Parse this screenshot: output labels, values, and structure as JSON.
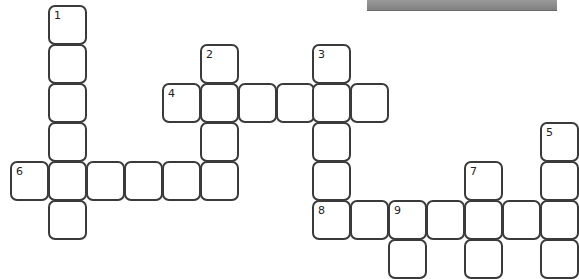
{
  "puzzle": {
    "type": "crossword",
    "geometry": {
      "col_x": [
        10,
        48,
        86,
        124,
        162,
        200,
        238,
        276,
        312,
        350,
        388,
        426,
        464,
        502,
        540
      ],
      "row_y": [
        5,
        44,
        83,
        122,
        161,
        200,
        239
      ]
    },
    "cells": [
      {
        "r": 0,
        "c": 1,
        "num": "1"
      },
      {
        "r": 1,
        "c": 1
      },
      {
        "r": 1,
        "c": 5,
        "num": "2"
      },
      {
        "r": 1,
        "c": 8,
        "num": "3"
      },
      {
        "r": 2,
        "c": 1
      },
      {
        "r": 2,
        "c": 4,
        "num": "4"
      },
      {
        "r": 2,
        "c": 5
      },
      {
        "r": 2,
        "c": 6
      },
      {
        "r": 2,
        "c": 7
      },
      {
        "r": 2,
        "c": 8
      },
      {
        "r": 2,
        "c": 9
      },
      {
        "r": 3,
        "c": 1
      },
      {
        "r": 3,
        "c": 5
      },
      {
        "r": 3,
        "c": 8
      },
      {
        "r": 3,
        "c": 14,
        "num": "5"
      },
      {
        "r": 4,
        "c": 0,
        "num": "6"
      },
      {
        "r": 4,
        "c": 1
      },
      {
        "r": 4,
        "c": 2
      },
      {
        "r": 4,
        "c": 3
      },
      {
        "r": 4,
        "c": 4
      },
      {
        "r": 4,
        "c": 5
      },
      {
        "r": 4,
        "c": 8
      },
      {
        "r": 4,
        "c": 12,
        "num": "7"
      },
      {
        "r": 4,
        "c": 14
      },
      {
        "r": 5,
        "c": 1
      },
      {
        "r": 5,
        "c": 8,
        "num": "8"
      },
      {
        "r": 5,
        "c": 9
      },
      {
        "r": 5,
        "c": 10,
        "num": "9"
      },
      {
        "r": 5,
        "c": 11
      },
      {
        "r": 5,
        "c": 12
      },
      {
        "r": 5,
        "c": 13
      },
      {
        "r": 5,
        "c": 14
      },
      {
        "r": 6,
        "c": 10
      },
      {
        "r": 6,
        "c": 12
      },
      {
        "r": 6,
        "c": 14
      }
    ],
    "clue_numbers": [
      "1",
      "2",
      "3",
      "4",
      "5",
      "6",
      "7",
      "8",
      "9"
    ]
  },
  "colors": {
    "cell_border": "#3a3a3a",
    "cell_fill": "#ffffff",
    "topbar": "#8c8c8c"
  }
}
